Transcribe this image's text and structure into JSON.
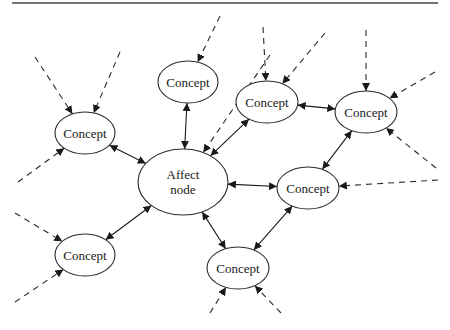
{
  "diagram": {
    "title": "",
    "colors": {
      "stroke": "#1a1a1a",
      "background": "#ffffff"
    },
    "nodes": [
      {
        "id": "affect",
        "label_lines": [
          "Affect",
          "node"
        ],
        "cx": 183,
        "cy": 182,
        "rx": 45,
        "ry": 33
      },
      {
        "id": "c1",
        "label": "Concept",
        "cx": 85,
        "cy": 133,
        "rx": 30,
        "ry": 21
      },
      {
        "id": "c2",
        "label": "Concept",
        "cx": 188,
        "cy": 82,
        "rx": 30,
        "ry": 21
      },
      {
        "id": "c3",
        "label": "Concept",
        "cx": 267,
        "cy": 102,
        "rx": 31,
        "ry": 21
      },
      {
        "id": "c4",
        "label": "Concept",
        "cx": 366,
        "cy": 112,
        "rx": 31,
        "ry": 21
      },
      {
        "id": "c5",
        "label": "Concept",
        "cx": 308,
        "cy": 188,
        "rx": 31,
        "ry": 21
      },
      {
        "id": "c6",
        "label": "Concept",
        "cx": 85,
        "cy": 255,
        "rx": 30,
        "ry": 21
      },
      {
        "id": "c7",
        "label": "Concept",
        "cx": 238,
        "cy": 268,
        "rx": 31,
        "ry": 21
      }
    ],
    "bidirectional_edges": [
      [
        "affect",
        "c1"
      ],
      [
        "affect",
        "c2"
      ],
      [
        "affect",
        "c3"
      ],
      [
        "affect",
        "c5"
      ],
      [
        "affect",
        "c6"
      ],
      [
        "affect",
        "c7"
      ],
      [
        "c3",
        "c4"
      ],
      [
        "c4",
        "c5"
      ],
      [
        "c5",
        "c7"
      ]
    ],
    "incoming_dashed_edges": [
      {
        "to": "c1",
        "from": [
          35,
          57
        ]
      },
      {
        "to": "c1",
        "from": [
          120,
          52
        ]
      },
      {
        "to": "c1",
        "from": [
          18,
          182
        ]
      },
      {
        "to": "c2",
        "from": [
          220,
          16
        ]
      },
      {
        "to": "c3",
        "from": [
          263,
          27
        ]
      },
      {
        "to": "c3",
        "from": [
          325,
          33
        ]
      },
      {
        "to": "c4",
        "from": [
          366,
          30
        ]
      },
      {
        "to": "c4",
        "from": [
          435,
          72
        ]
      },
      {
        "to": "c4",
        "from": [
          436,
          168
        ]
      },
      {
        "to": "c5",
        "from": [
          438,
          180
        ]
      },
      {
        "to": "c6",
        "from": [
          15,
          213
        ]
      },
      {
        "to": "c6",
        "from": [
          15,
          302
        ]
      },
      {
        "to": "c7",
        "from": [
          210,
          313
        ]
      },
      {
        "to": "c7",
        "from": [
          281,
          313
        ]
      },
      {
        "to": "affect",
        "from": [
          270,
          55
        ]
      }
    ]
  }
}
